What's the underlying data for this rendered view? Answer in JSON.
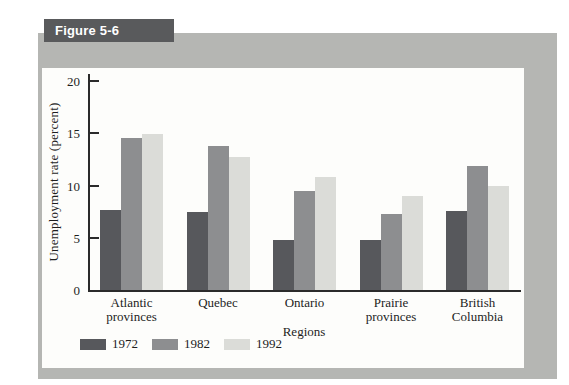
{
  "figure": {
    "label": "Figure 5-6"
  },
  "chart_data": {
    "type": "bar",
    "title": "",
    "xlabel": "Regions",
    "ylabel": "Unemployment rate (percent)",
    "ylim": [
      0,
      20
    ],
    "yticks": [
      0,
      5,
      10,
      15,
      20
    ],
    "grid": false,
    "legend_position": "bottom-left",
    "categories": [
      "Atlantic provinces",
      "Quebec",
      "Ontario",
      "Prairie provinces",
      "British Columbia"
    ],
    "series": [
      {
        "name": "1972",
        "color": "#57585c",
        "values": [
          7.7,
          7.5,
          4.8,
          4.8,
          7.6
        ]
      },
      {
        "name": "1982",
        "color": "#8d8e90",
        "values": [
          14.5,
          13.8,
          9.5,
          7.3,
          11.9
        ]
      },
      {
        "name": "1992",
        "color": "#dbdcd8",
        "values": [
          14.9,
          12.7,
          10.8,
          9.0,
          10.0
        ]
      }
    ]
  },
  "colors": {
    "panel": "#b5b6b3",
    "tab_bg": "#595a5c",
    "tab_text": "#ffffff",
    "box_bg": "#fdfdfb",
    "axis": "#2b2b2b"
  }
}
